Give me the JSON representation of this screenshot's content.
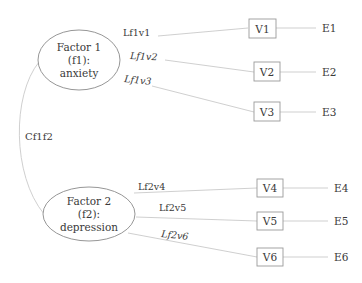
{
  "diagram": {
    "type": "confirmatory-factor-analysis path diagram",
    "factors": [
      {
        "id": "f1",
        "lines": [
          "Factor 1",
          "(f1):",
          "anxiety"
        ],
        "cx": 79,
        "cy": 60,
        "rx": 41,
        "ry": 30
      },
      {
        "id": "f2",
        "lines": [
          "Factor 2",
          "(f2):",
          "depression"
        ],
        "cx": 89,
        "cy": 214,
        "rx": 46,
        "ry": 27
      }
    ],
    "covariance": {
      "label": "Cf1f2",
      "between": [
        "f1",
        "f2"
      ]
    },
    "loadings": [
      {
        "label": "Lf1v1",
        "from": "f1",
        "to": "V1"
      },
      {
        "label": "Lf1v2",
        "from": "f1",
        "to": "V2"
      },
      {
        "label": "Lf1v3",
        "from": "f1",
        "to": "V3"
      },
      {
        "label": "Lf2v4",
        "from": "f2",
        "to": "V4"
      },
      {
        "label": "Lf2v5",
        "from": "f2",
        "to": "V5"
      },
      {
        "label": "Lf2v6",
        "from": "f2",
        "to": "V6"
      }
    ],
    "variables": [
      "V1",
      "V2",
      "V3",
      "V4",
      "V5",
      "V6"
    ],
    "errors": [
      "E1",
      "E2",
      "E3",
      "E4",
      "E5",
      "E6"
    ],
    "colors": {
      "text": "#3a3a3a",
      "edge": "#c9c9c9",
      "ellipse_stroke": "#8a8a8a",
      "box_stroke": "#9a9a9a",
      "background": "#ffffff"
    }
  }
}
